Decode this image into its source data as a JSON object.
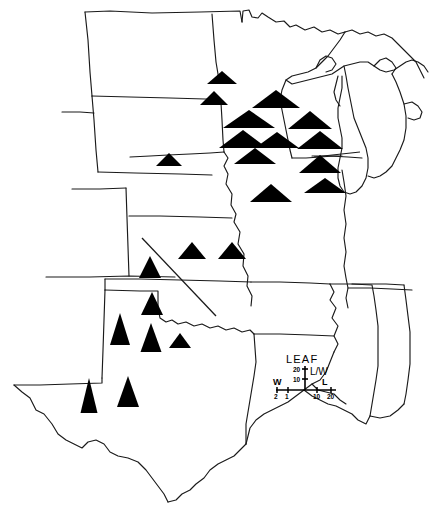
{
  "figure": {
    "type": "thematic-symbol-map",
    "region": "Central and Midwestern United States",
    "symbol_description": "Filled black triangles whose width represents leaf width (W) and whose height represents leaf length (L); the shape therefore encodes the leaf length-to-width ratio (L/W) at each sample locality."
  },
  "legend": {
    "title": "LEAF",
    "ratio_label": "L/W",
    "ratio_ticks": [
      "20",
      "10"
    ],
    "width_axis_label": "W",
    "length_axis_label": "L",
    "width_ticks": [
      "2",
      "1"
    ],
    "length_ticks": [
      "10",
      "20"
    ]
  },
  "colors": {
    "symbol_fill": "#000000",
    "outline": "#1a1a1a",
    "background": "#ffffff"
  },
  "chart_data": {
    "type": "scatter",
    "title": "LEAF",
    "xlabel": "",
    "ylabel": "",
    "legend_position": "lower-right",
    "grid": false,
    "value_key": "L/W ratio encoded by triangle height/width",
    "symbols": [
      {
        "id": "s01",
        "x": 222,
        "y": 84,
        "w": 30,
        "h": 13,
        "lw": 2.3
      },
      {
        "id": "s02",
        "x": 214,
        "y": 105,
        "w": 28,
        "h": 14,
        "lw": 2.5
      },
      {
        "id": "s03",
        "x": 276,
        "y": 108,
        "w": 48,
        "h": 18,
        "lw": 1.5
      },
      {
        "id": "s04",
        "x": 249,
        "y": 128,
        "w": 52,
        "h": 18,
        "lw": 1.4
      },
      {
        "id": "s05",
        "x": 310,
        "y": 129,
        "w": 44,
        "h": 18,
        "lw": 1.6
      },
      {
        "id": "s06",
        "x": 243,
        "y": 148,
        "w": 48,
        "h": 18,
        "lw": 1.5
      },
      {
        "id": "s07",
        "x": 277,
        "y": 148,
        "w": 44,
        "h": 16,
        "lw": 1.6
      },
      {
        "id": "s08",
        "x": 320,
        "y": 149,
        "w": 46,
        "h": 18,
        "lw": 1.5
      },
      {
        "id": "s09",
        "x": 169,
        "y": 166,
        "w": 26,
        "h": 13,
        "lw": 2.4
      },
      {
        "id": "s10",
        "x": 255,
        "y": 164,
        "w": 42,
        "h": 16,
        "lw": 1.7
      },
      {
        "id": "s11",
        "x": 320,
        "y": 173,
        "w": 42,
        "h": 18,
        "lw": 1.6
      },
      {
        "id": "s12",
        "x": 325,
        "y": 193,
        "w": 42,
        "h": 15,
        "lw": 1.6
      },
      {
        "id": "s13",
        "x": 271,
        "y": 202,
        "w": 42,
        "h": 18,
        "lw": 1.6
      },
      {
        "id": "s14",
        "x": 192,
        "y": 259,
        "w": 28,
        "h": 17,
        "lw": 2.7
      },
      {
        "id": "s15",
        "x": 232,
        "y": 259,
        "w": 28,
        "h": 17,
        "lw": 2.7
      },
      {
        "id": "s16",
        "x": 150,
        "y": 278,
        "w": 22,
        "h": 22,
        "lw": 4.5
      },
      {
        "id": "s17",
        "x": 152,
        "y": 315,
        "w": 22,
        "h": 23,
        "lw": 4.6
      },
      {
        "id": "s18",
        "x": 120,
        "y": 345,
        "w": 20,
        "h": 32,
        "lw": 7.0
      },
      {
        "id": "s19",
        "x": 151,
        "y": 352,
        "w": 21,
        "h": 29,
        "lw": 6.5
      },
      {
        "id": "s20",
        "x": 180,
        "y": 348,
        "w": 22,
        "h": 15,
        "lw": 3.0
      },
      {
        "id": "s21",
        "x": 89,
        "y": 413,
        "w": 17,
        "h": 35,
        "lw": 8.5
      },
      {
        "id": "s22",
        "x": 128,
        "y": 407,
        "w": 22,
        "h": 31,
        "lw": 6.2
      }
    ],
    "trend_line": {
      "x1": 142,
      "y1": 238,
      "x2": 216,
      "y2": 316,
      "description": "diagonal trend line across the central plains"
    },
    "leader_lines": [
      {
        "x1": 315,
        "y1": 156,
        "x2": 358,
        "y2": 152,
        "description": "leader line from a triangle to the Lake Michigan shoreline"
      }
    ],
    "note": "Triangle aspect (width vs height) varies geographically: broad low triangles (low L/W) in the north, narrow tall triangles (high L/W) in the south."
  }
}
